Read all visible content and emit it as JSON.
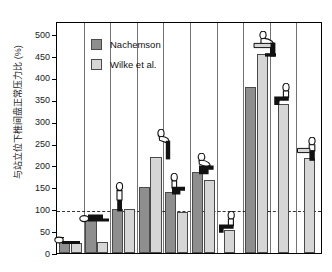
{
  "chart_data": {
    "type": "bar",
    "title": "",
    "xlabel": "",
    "ylabel": "与站立位下椎间盘正常压力比 (%)",
    "ylim": [
      0,
      530
    ],
    "yticks": [
      0,
      50,
      100,
      150,
      200,
      250,
      300,
      350,
      400,
      450,
      500
    ],
    "grid": false,
    "legend_position": "top-left",
    "reference_line": {
      "value": 100,
      "style": "dashed"
    },
    "categories": [
      "Lying supine",
      "Lying on side",
      "Standing upright",
      "Standing, bent forward",
      "Sitting relaxed",
      "Sitting, bent forward",
      "Sitting slouched",
      "Standing, lifting load bent",
      "Sitting, holding load",
      "Standing, holding load"
    ],
    "series": [
      {
        "name": "Nachemson",
        "color": "#8e8e8e",
        "values": [
          25,
          75,
          100,
          150,
          140,
          185,
          null,
          380,
          null,
          null
        ]
      },
      {
        "name": "Wilke et al.",
        "color": "#d6d6d6",
        "values": [
          22,
          25,
          100,
          220,
          93,
          167,
          52,
          455,
          340,
          218
        ]
      }
    ]
  },
  "legend": {
    "items": [
      {
        "label": "Nachemson",
        "swatch": "nach"
      },
      {
        "label": "Wilke et al.",
        "swatch": "wilke"
      }
    ]
  },
  "axis": {
    "y_title": "与站立位下椎间盘正常压力比 (%)",
    "y_ticks": [
      "0",
      "50",
      "100",
      "150",
      "200",
      "250",
      "300",
      "350",
      "400",
      "450",
      "500"
    ]
  },
  "colors": {
    "nachemson": "#8e8e8e",
    "wilke": "#d6d6d6",
    "frame": "#000000",
    "refline": "#333333",
    "text": "#1a1a1a"
  },
  "pictograms": [
    {
      "name": "figure-lying-supine",
      "group": 0
    },
    {
      "name": "figure-lying-on-side",
      "group": 1
    },
    {
      "name": "figure-standing-upright",
      "group": 2
    },
    {
      "name": "figure-standing-bent-forward",
      "group": 3
    },
    {
      "name": "figure-sitting-relaxed",
      "group": 4
    },
    {
      "name": "figure-sitting-bent-forward",
      "group": 5
    },
    {
      "name": "figure-sitting-slouched",
      "group": 6
    },
    {
      "name": "figure-lifting-load-bent",
      "group": 7
    },
    {
      "name": "figure-sitting-holding-load",
      "group": 8
    },
    {
      "name": "figure-standing-holding-load",
      "group": 9
    }
  ]
}
